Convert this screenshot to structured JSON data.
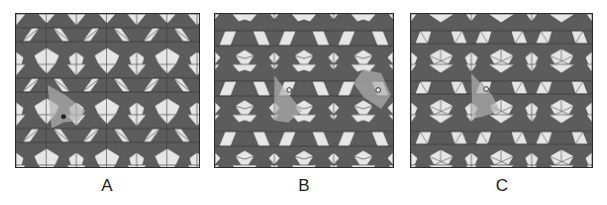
{
  "figure": {
    "colors": {
      "dark_tile": "#5c5c5c",
      "light_tile": "#e6e6e6",
      "highlight": "#9a9a9a",
      "line": "#2a2a2a"
    },
    "panels": [
      {
        "id": "A",
        "label": "A",
        "description": "Periodic tiling with vertical mirror lines and trapezoid rows with diagonals; highlighted fundamental region with rotation center marker"
      },
      {
        "id": "B",
        "label": "B",
        "description": "Periodic tiling with trapezoids and folded quadrilaterals; two highlighted fundamental regions with rotation center markers"
      },
      {
        "id": "C",
        "label": "C",
        "description": "Periodic tiling with trapezoids and subdivided pentagons; highlighted fundamental region with rotation center marker"
      }
    ]
  }
}
